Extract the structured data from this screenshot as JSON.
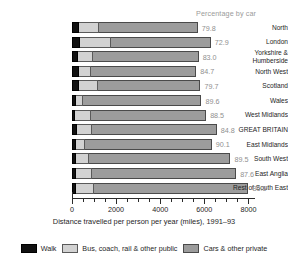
{
  "header": {
    "percentage_note": "Percentage by car"
  },
  "axis": {
    "title": "Distance travelled per person per year (miles), 1991–93",
    "tick_labels": [
      "0",
      "2000",
      "4000",
      "6000",
      "8000"
    ],
    "tick_values": [
      0,
      2000,
      4000,
      6000,
      8000
    ],
    "minor_tick_step": 500,
    "xmin": 0,
    "xmax": 8250
  },
  "legend": {
    "items": [
      {
        "label": "Walk",
        "color": "#111111",
        "key": "walk"
      },
      {
        "label": "Bus, coach, rail & other public",
        "color": "#d2d2d2",
        "key": "public"
      },
      {
        "label": "Cars & other private",
        "color": "#9c9c9c",
        "key": "private"
      }
    ]
  },
  "chart_data": {
    "type": "bar",
    "orientation": "horizontal",
    "stacked": true,
    "title": "",
    "xlabel": "Distance travelled per person per year (miles), 1991–93",
    "ylabel": "",
    "xlim": [
      0,
      8250
    ],
    "grid": false,
    "legend_position": "bottom",
    "value_label_header": "Percentage by car",
    "categories": [
      "North",
      "London",
      "Yorkshire &\nHumberside",
      "North West",
      "Scotland",
      "Wales",
      "West Midlands",
      "GREAT BRITAIN",
      "East Midlands",
      "South West",
      "East Anglia",
      "Rest of South East"
    ],
    "series": [
      {
        "name": "Walk",
        "color": "#111111",
        "values": [
          330,
          340,
          290,
          300,
          310,
          180,
          150,
          230,
          200,
          190,
          200,
          190
        ]
      },
      {
        "name": "Bus, coach, rail & other public",
        "color": "#d2d2d2",
        "values": [
          900,
          1420,
          670,
          540,
          880,
          340,
          690,
          660,
          370,
          560,
          700,
          830
        ]
      },
      {
        "name": "Cars & other private",
        "color": "#9c9c9c",
        "values": [
          4470,
          4530,
          4780,
          4790,
          4630,
          5350,
          5240,
          5670,
          5760,
          6430,
          6540,
          6980
        ]
      }
    ],
    "value_labels": [
      "79.8",
      "72.9",
      "83.0",
      "84.7",
      "79.7",
      "89.6",
      "88.5",
      "84.8",
      "90.1",
      "89.5",
      "87.6",
      "86.5"
    ],
    "value_label_units": "%"
  }
}
